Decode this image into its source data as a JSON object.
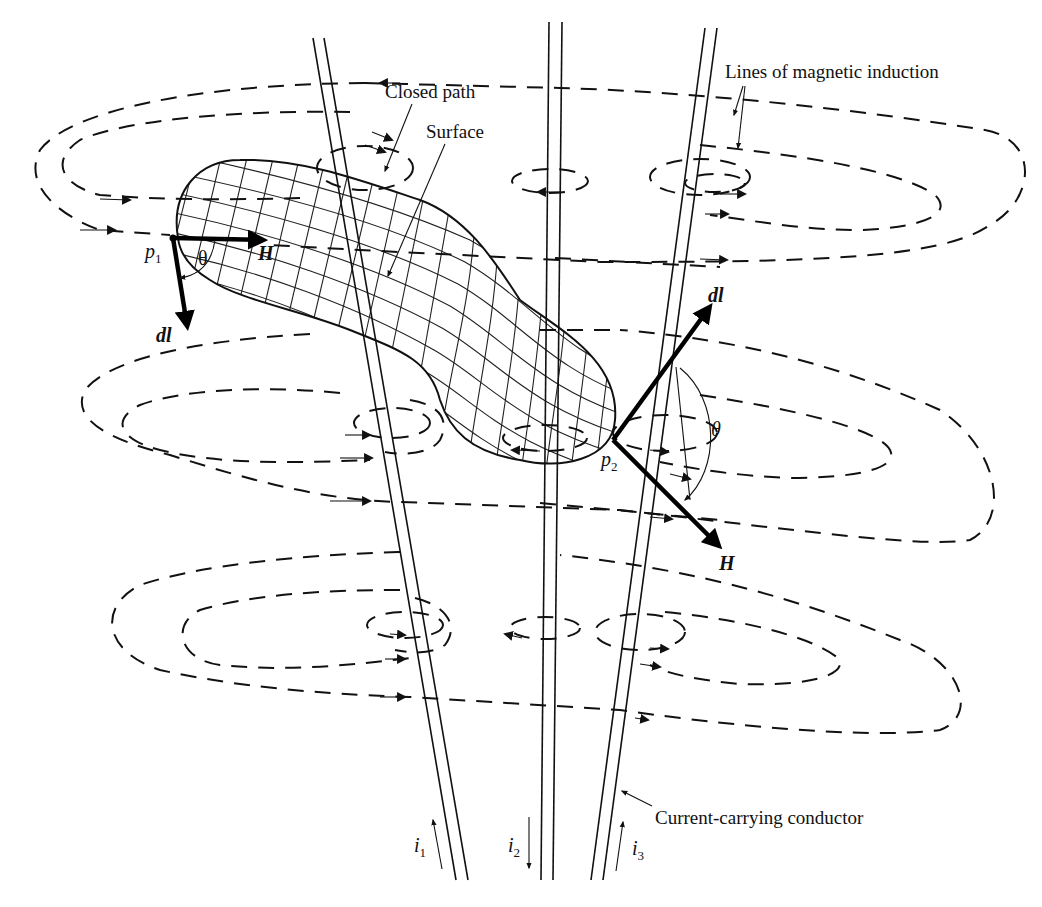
{
  "figure": {
    "labels": {
      "lines_of_induction": "Lines of magnetic induction",
      "closed_path": "Closed path",
      "surface": "Surface",
      "conductor": "Current-carrying conductor"
    },
    "points": {
      "p1": {
        "letter": "p",
        "sub": "1"
      },
      "p2": {
        "letter": "p",
        "sub": "2"
      }
    },
    "vectors": {
      "H_at_p1": "H",
      "dl_at_p1": "dl",
      "H_at_p2": "H",
      "dl_at_p2": "dl"
    },
    "angles": {
      "theta_p1": "θ",
      "theta_p2": "θ"
    },
    "currents": [
      {
        "letter": "i",
        "sub": "1",
        "direction": "up"
      },
      {
        "letter": "i",
        "sub": "2",
        "direction": "down"
      },
      {
        "letter": "i",
        "sub": "3",
        "direction": "up"
      }
    ],
    "colors": {
      "ink": "#111111",
      "background": "#ffffff"
    }
  }
}
